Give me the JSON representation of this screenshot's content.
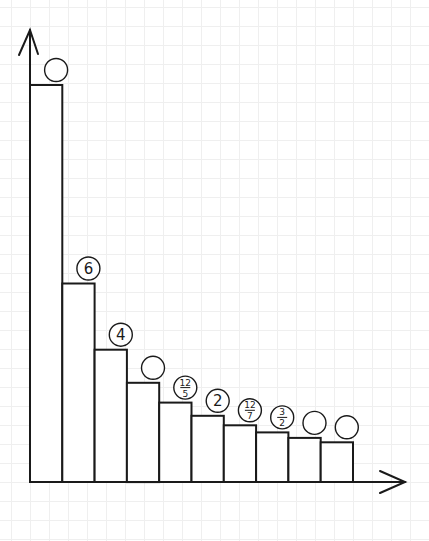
{
  "chart_data": {
    "type": "bar",
    "title": "",
    "xlabel": "",
    "ylabel": "",
    "categories": [
      "1",
      "2",
      "3",
      "4",
      "5",
      "6",
      "7",
      "8",
      "9",
      "10"
    ],
    "values": [
      12,
      6,
      4,
      3,
      2.4,
      2,
      1.714,
      1.5,
      1.333,
      1.2
    ],
    "labels": [
      "",
      "6",
      "4",
      "",
      "12/5",
      "2",
      "12/7",
      "3/2",
      "",
      ""
    ],
    "ylim": [
      0,
      12.7
    ],
    "grid": true,
    "legend": null,
    "axes": {
      "x_arrow": true,
      "y_arrow": true,
      "ticks": false
    }
  },
  "style": {
    "stroke": "#1a1a1a",
    "bar_fill": "#ffffff",
    "grid": "#efefef",
    "background": "#ffffff"
  }
}
